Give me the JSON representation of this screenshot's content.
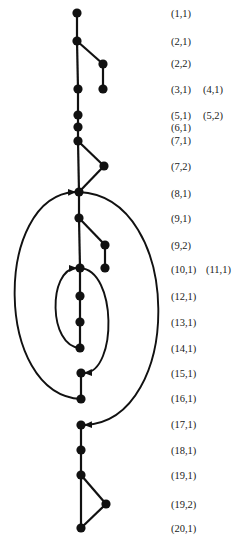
{
  "diagram": {
    "type": "control-flow-graph",
    "colors": {
      "ink": "#111111",
      "background": "#ffffff"
    },
    "nodes": [
      {
        "id": "n1_1",
        "x": 77,
        "y": 13
      },
      {
        "id": "n2_1",
        "x": 77,
        "y": 41
      },
      {
        "id": "n2_2",
        "x": 103,
        "y": 64
      },
      {
        "id": "n3_1",
        "x": 78,
        "y": 89
      },
      {
        "id": "n4_1",
        "x": 103,
        "y": 89
      },
      {
        "id": "n5_1",
        "x": 78,
        "y": 115
      },
      {
        "id": "n6_1",
        "x": 78,
        "y": 127
      },
      {
        "id": "n7_1",
        "x": 78,
        "y": 141
      },
      {
        "id": "n7_2",
        "x": 104,
        "y": 166
      },
      {
        "id": "n8_1",
        "x": 79,
        "y": 192
      },
      {
        "id": "n9_1",
        "x": 79,
        "y": 218
      },
      {
        "id": "n9_2",
        "x": 105,
        "y": 245
      },
      {
        "id": "n10_1",
        "x": 80,
        "y": 268
      },
      {
        "id": "n11_1",
        "x": 105,
        "y": 268
      },
      {
        "id": "n12_1",
        "x": 80,
        "y": 296
      },
      {
        "id": "n13_1",
        "x": 80,
        "y": 322
      },
      {
        "id": "n14_1",
        "x": 80,
        "y": 348
      },
      {
        "id": "n15_1",
        "x": 81,
        "y": 373
      },
      {
        "id": "n16_1",
        "x": 81,
        "y": 399
      },
      {
        "id": "n17_1",
        "x": 81,
        "y": 425
      },
      {
        "id": "n18_1",
        "x": 81,
        "y": 450
      },
      {
        "id": "n19_1",
        "x": 81,
        "y": 475
      },
      {
        "id": "n19_2",
        "x": 106,
        "y": 504
      },
      {
        "id": "n20_1",
        "x": 81,
        "y": 528
      }
    ],
    "edges": [
      [
        "n1_1",
        "n2_1"
      ],
      [
        "n2_1",
        "n3_1"
      ],
      [
        "n2_1",
        "n2_2"
      ],
      [
        "n2_2",
        "n4_1"
      ],
      [
        "n3_1",
        "n5_1"
      ],
      [
        "n5_1",
        "n6_1"
      ],
      [
        "n6_1",
        "n7_1"
      ],
      [
        "n7_1",
        "n8_1"
      ],
      [
        "n7_1",
        "n7_2"
      ],
      [
        "n7_2",
        "n8_1"
      ],
      [
        "n8_1",
        "n9_1"
      ],
      [
        "n9_1",
        "n10_1"
      ],
      [
        "n9_1",
        "n9_2"
      ],
      [
        "n9_2",
        "n11_1"
      ],
      [
        "n10_1",
        "n12_1"
      ],
      [
        "n12_1",
        "n13_1"
      ],
      [
        "n13_1",
        "n14_1"
      ],
      [
        "n15_1",
        "n16_1"
      ],
      [
        "n17_1",
        "n18_1"
      ],
      [
        "n18_1",
        "n19_1"
      ],
      [
        "n19_1",
        "n20_1"
      ],
      [
        "n19_1",
        "n19_2"
      ],
      [
        "n19_2",
        "n20_1"
      ]
    ],
    "arcs": [
      {
        "name": "loop-back-16-to-8",
        "from": "n16_1",
        "to": "n8_1",
        "side": "left",
        "extent_x": 15
      },
      {
        "name": "exit-8-to-17",
        "from": "n8_1",
        "to": "n17_1",
        "side": "right",
        "extent_x": 158
      },
      {
        "name": "loop-back-14-to-10",
        "from": "n14_1",
        "to": "n10_1",
        "side": "left",
        "extent_x": 56
      },
      {
        "name": "exit-10-to-15",
        "from": "n10_1",
        "to": "n15_1",
        "side": "right",
        "extent_x": 108
      }
    ],
    "labels": [
      {
        "text": "(1,1)",
        "x": 171,
        "y": 17
      },
      {
        "text": "(2,1)",
        "x": 171,
        "y": 45
      },
      {
        "text": "(2,2)",
        "x": 171,
        "y": 67
      },
      {
        "text": "(3,1)",
        "x": 171,
        "y": 93
      },
      {
        "text": "(4,1)",
        "x": 203,
        "y": 93
      },
      {
        "text": "(5,1)",
        "x": 171,
        "y": 119
      },
      {
        "text": "(5,2)",
        "x": 203,
        "y": 119
      },
      {
        "text": "(6,1)",
        "x": 171,
        "y": 131
      },
      {
        "text": "(7,1)",
        "x": 171,
        "y": 144
      },
      {
        "text": "(7,2)",
        "x": 171,
        "y": 170
      },
      {
        "text": "(8,1)",
        "x": 171,
        "y": 197
      },
      {
        "text": "(9,1)",
        "x": 171,
        "y": 222
      },
      {
        "text": "(9,2)",
        "x": 171,
        "y": 249
      },
      {
        "text": "(10,1)",
        "x": 171,
        "y": 273
      },
      {
        "text": "(11,1)",
        "x": 206,
        "y": 273
      },
      {
        "text": "(12,1)",
        "x": 171,
        "y": 300
      },
      {
        "text": "(13,1)",
        "x": 171,
        "y": 326
      },
      {
        "text": "(14,1)",
        "x": 171,
        "y": 352
      },
      {
        "text": "(15,1)",
        "x": 171,
        "y": 377
      },
      {
        "text": "(16,1)",
        "x": 171,
        "y": 402
      },
      {
        "text": "(17,1)",
        "x": 171,
        "y": 428
      },
      {
        "text": "(18,1)",
        "x": 171,
        "y": 454
      },
      {
        "text": "(19,1)",
        "x": 171,
        "y": 479
      },
      {
        "text": "(19,2)",
        "x": 171,
        "y": 508
      },
      {
        "text": "(20,1)",
        "x": 171,
        "y": 532
      }
    ]
  }
}
